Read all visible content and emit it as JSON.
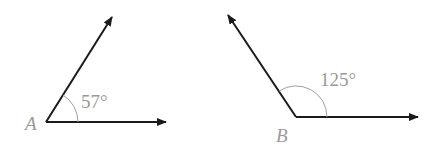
{
  "diagram": {
    "angles": [
      {
        "vertex_label": "A",
        "measure_label": "57°",
        "degrees": 57
      },
      {
        "vertex_label": "B",
        "measure_label": "125°",
        "degrees": 125
      }
    ],
    "colors": {
      "ray": "#1a1a1a",
      "arc": "#a0a0a0",
      "text": "#9a9a9a"
    }
  }
}
